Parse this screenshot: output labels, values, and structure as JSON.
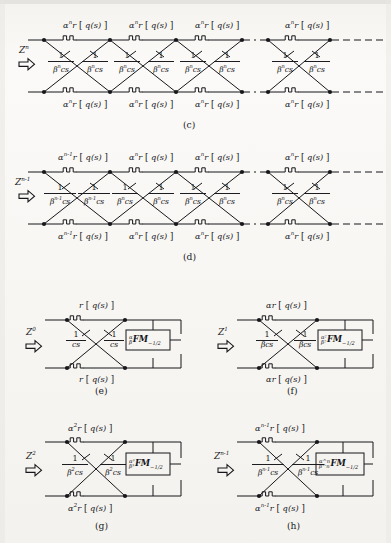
{
  "figure": {
    "type": "circuit-lattice-diagram",
    "ink_color": "#17161a",
    "paper_color": "#f6f5f2"
  },
  "panels": [
    {
      "id": "c",
      "caption": "(c)",
      "source_symbol": "Z",
      "source_exponent": "n",
      "top_branch_labels": [
        "α^n r [ q(s) ]",
        "α^n r [ q(s) ]",
        "α^n r [ q(s) ]",
        "α^n r [ q(s) ]"
      ],
      "bottom_branch_labels": [
        "α^n r [ q(s) ]",
        "α^n r [ q(s) ]",
        "α^n r [ q(s) ]",
        "α^n r [ q(s) ]"
      ],
      "cross_labels": [
        "1/(β^n cs)",
        "1/(β^n cs)",
        "1/(β^n cs)",
        "1/(β^n cs)",
        "1/(β^n cs)",
        "1/(β^n cs)",
        "1/(β^n cs)",
        "1/(β^n cs)"
      ],
      "branch_coef_base": "α",
      "branch_coef_exp": "n",
      "branch_body": "r",
      "branch_arg": "q(s)",
      "frac_num": "1",
      "frac_den_base": "β",
      "frac_den_exp": "n",
      "frac_den_tail": "cs",
      "continuation": true
    },
    {
      "id": "d",
      "caption": "(d)",
      "source_symbol": "Z",
      "source_exponent": "n-1",
      "first_branch_coef_exp": "n-1",
      "branch_coef_base": "α",
      "branch_coef_exp": "n",
      "branch_body": "r",
      "branch_arg": "q(s)",
      "frac_num": "1",
      "frac_den_base": "β",
      "frac_den_exp": "n",
      "first_frac_den_exp": "n-1",
      "frac_den_tail": "cs",
      "continuation": true
    },
    {
      "id": "e",
      "caption": "(e)",
      "source_symbol": "Z",
      "source_exponent": "0",
      "branch_label": "r [ q(s) ]",
      "branch_coef_base": "",
      "branch_coef_exp": "",
      "branch_body": "r",
      "branch_arg": "q(s)",
      "frac_num": "1",
      "frac_den_base": "",
      "frac_den_exp": "",
      "frac_den_tail": "cs",
      "box_label": "α/β FM −1/2",
      "box_pre_top": "α",
      "box_pre_bottom": "β",
      "box_main": "FM",
      "box_sub": "−1/2"
    },
    {
      "id": "f",
      "caption": "(f)",
      "source_symbol": "Z",
      "source_exponent": "1",
      "branch_label": "αr [ q(s) ]",
      "branch_coef_base": "α",
      "branch_coef_exp": "",
      "branch_body": "r",
      "branch_arg": "q(s)",
      "frac_num": "1",
      "frac_den_base": "β",
      "frac_den_exp": "",
      "frac_den_tail": "cs",
      "box_pre_top": "α²",
      "box_pre_bottom": "β²",
      "box_main": "FM",
      "box_sub": "−1/2"
    },
    {
      "id": "g",
      "caption": "(g)",
      "source_symbol": "Z",
      "source_exponent": "2",
      "branch_label": "α² r [ q(s) ]",
      "branch_coef_base": "α",
      "branch_coef_exp": "2",
      "branch_body": "r",
      "branch_arg": "q(s)",
      "frac_num": "1",
      "frac_den_base": "β",
      "frac_den_exp": "2",
      "frac_den_tail": "cs",
      "box_pre_top": "α³",
      "box_pre_bottom": "β³",
      "box_main": "FM",
      "box_sub": "−1/2"
    },
    {
      "id": "h",
      "caption": "(h)",
      "source_symbol": "Z",
      "source_exponent": "n-1",
      "branch_label": "α^(n-1) r [ q(s) ]",
      "branch_coef_base": "α",
      "branch_coef_exp": "n-1",
      "branch_body": "r",
      "branch_arg": "q(s)",
      "frac_num": "1",
      "frac_den_base": "β",
      "frac_den_exp": "n-1",
      "frac_den_tail": "cs",
      "box_pre_top": "α^n",
      "box_pre_bottom": "β^n",
      "box_main": "FM",
      "box_sub": "−1/2"
    }
  ],
  "glyphs": {
    "arrow": "⇨",
    "bracket_open": "[",
    "bracket_close": "]"
  }
}
